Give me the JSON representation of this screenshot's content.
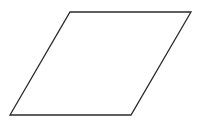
{
  "diagram": {
    "shape": "parallelogram",
    "stroke_color": "#2a2a2a",
    "fill_color": "#ffffff",
    "stroke_width": 1.3,
    "vertices": [
      {
        "x": 70,
        "y": 12
      },
      {
        "x": 191,
        "y": 12
      },
      {
        "x": 131,
        "y": 115
      },
      {
        "x": 10,
        "y": 115
      }
    ]
  }
}
